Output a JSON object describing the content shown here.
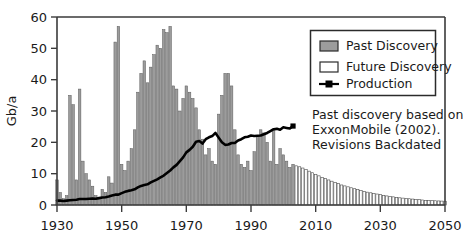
{
  "chart_data": {
    "type": "bar",
    "title": "",
    "subtitle": "",
    "xlabel": "",
    "ylabel": "Gb/a",
    "xlim": [
      1930,
      2050
    ],
    "ylim": [
      0,
      60
    ],
    "grid": false,
    "legend_position": "top-right",
    "x_ticks": [
      1930,
      1950,
      1970,
      1990,
      2010,
      2030,
      2050
    ],
    "x_tick_labels": [
      "1930",
      "1950",
      "1970",
      "1990",
      "2010",
      "2030",
      "2050"
    ],
    "y_ticks": [
      0,
      10,
      20,
      30,
      40,
      50,
      60
    ],
    "y_tick_labels": [
      "0",
      "10",
      "20",
      "30",
      "40",
      "50",
      "60"
    ],
    "legend": [
      {
        "label": "Past Discovery",
        "marker": "filled-gray-box"
      },
      {
        "label": "Future Discovery",
        "marker": "empty-white-box"
      },
      {
        "label": "Production",
        "marker": "line-with-square"
      }
    ],
    "annotation": {
      "lines": [
        "Past discovery based on",
        "ExxonMobile (2002).",
        "Revisions Backdated"
      ]
    },
    "colors": {
      "past_discovery_fill": "#9c9c9c",
      "past_discovery_stroke": "#5a5a5a",
      "future_discovery_fill": "#ffffff",
      "future_discovery_stroke": "#4a4a4a",
      "production_line": "#000000",
      "axis": "#3b3b3b",
      "background": "#ffffff"
    },
    "series": [
      {
        "name": "Past Discovery",
        "type": "bar",
        "x": [
          1930,
          1931,
          1932,
          1933,
          1934,
          1935,
          1936,
          1937,
          1938,
          1939,
          1940,
          1941,
          1942,
          1943,
          1944,
          1945,
          1946,
          1947,
          1948,
          1949,
          1950,
          1951,
          1952,
          1953,
          1954,
          1955,
          1956,
          1957,
          1958,
          1959,
          1960,
          1961,
          1962,
          1963,
          1964,
          1965,
          1966,
          1967,
          1968,
          1969,
          1970,
          1971,
          1972,
          1973,
          1974,
          1975,
          1976,
          1977,
          1978,
          1979,
          1980,
          1981,
          1982,
          1983,
          1984,
          1985,
          1986,
          1987,
          1988,
          1989,
          1990,
          1991,
          1992,
          1993,
          1994,
          1995,
          1996,
          1997,
          1998,
          1999,
          2000,
          2001,
          2002,
          2003
        ],
        "values": [
          8,
          4,
          2,
          3,
          35,
          32,
          8,
          37,
          14,
          10,
          8,
          6,
          3,
          2,
          5,
          4,
          9,
          7,
          52,
          57,
          13,
          11,
          14,
          18,
          24,
          36,
          42,
          46,
          39,
          44,
          48,
          51,
          50,
          56,
          55,
          57,
          38,
          37,
          30,
          34,
          38,
          36,
          34,
          31,
          24,
          21,
          16,
          18,
          14,
          13,
          29,
          35,
          42,
          42,
          38,
          24,
          16,
          13,
          12,
          14,
          11,
          17,
          22,
          24,
          23,
          20,
          14,
          24,
          13,
          18,
          16,
          14,
          12,
          13
        ]
      },
      {
        "name": "Future Discovery",
        "type": "bar",
        "x": [
          2004,
          2005,
          2006,
          2007,
          2008,
          2009,
          2010,
          2011,
          2012,
          2013,
          2014,
          2015,
          2016,
          2017,
          2018,
          2019,
          2020,
          2021,
          2022,
          2023,
          2024,
          2025,
          2026,
          2027,
          2028,
          2029,
          2030,
          2031,
          2032,
          2033,
          2034,
          2035,
          2036,
          2037,
          2038,
          2039,
          2040,
          2041,
          2042,
          2043,
          2044,
          2045,
          2046,
          2047,
          2048,
          2049,
          2050
        ],
        "values": [
          12.5,
          12.2,
          11.8,
          11.3,
          10.8,
          10.3,
          9.8,
          9.3,
          8.8,
          8.4,
          8.0,
          7.6,
          7.2,
          6.8,
          6.4,
          6.1,
          5.8,
          5.5,
          5.2,
          4.9,
          4.6,
          4.3,
          4.1,
          3.9,
          3.7,
          3.5,
          3.3,
          3.1,
          2.9,
          2.7,
          2.6,
          2.4,
          2.3,
          2.2,
          2.1,
          2.0,
          1.9,
          1.8,
          1.7,
          1.6,
          1.5,
          1.45,
          1.4,
          1.35,
          1.3,
          1.25,
          1.2
        ]
      },
      {
        "name": "Production",
        "type": "line",
        "x": [
          1930,
          1931,
          1932,
          1933,
          1934,
          1935,
          1936,
          1937,
          1938,
          1939,
          1940,
          1941,
          1942,
          1943,
          1944,
          1945,
          1946,
          1947,
          1948,
          1949,
          1950,
          1951,
          1952,
          1953,
          1954,
          1955,
          1956,
          1957,
          1958,
          1959,
          1960,
          1961,
          1962,
          1963,
          1964,
          1965,
          1966,
          1967,
          1968,
          1969,
          1970,
          1971,
          1972,
          1973,
          1974,
          1975,
          1976,
          1977,
          1978,
          1979,
          1980,
          1981,
          1982,
          1983,
          1984,
          1985,
          1986,
          1987,
          1988,
          1989,
          1990,
          1991,
          1992,
          1993,
          1994,
          1995,
          1996,
          1997,
          1998,
          1999,
          2000,
          2001,
          2002,
          2003
        ],
        "values": [
          1.4,
          1.4,
          1.3,
          1.4,
          1.5,
          1.6,
          1.7,
          1.9,
          1.9,
          1.9,
          2.0,
          2.1,
          2.0,
          2.2,
          2.4,
          2.5,
          2.7,
          3.0,
          3.3,
          3.3,
          3.8,
          4.2,
          4.5,
          4.7,
          5.0,
          5.6,
          6.1,
          6.4,
          6.6,
          7.2,
          7.7,
          8.2,
          8.8,
          9.4,
          10.2,
          11.0,
          12.0,
          12.8,
          14.0,
          15.2,
          16.8,
          17.6,
          18.6,
          20.2,
          20.4,
          19.6,
          21.0,
          21.6,
          22.0,
          23.0,
          21.5,
          20.0,
          19.2,
          19.3,
          19.8,
          19.8,
          20.6,
          21.0,
          21.6,
          21.8,
          22.2,
          22.0,
          22.1,
          22.2,
          22.6,
          23.0,
          23.6,
          24.2,
          24.3,
          24.0,
          24.8,
          24.6,
          24.4,
          25.2
        ]
      }
    ]
  }
}
